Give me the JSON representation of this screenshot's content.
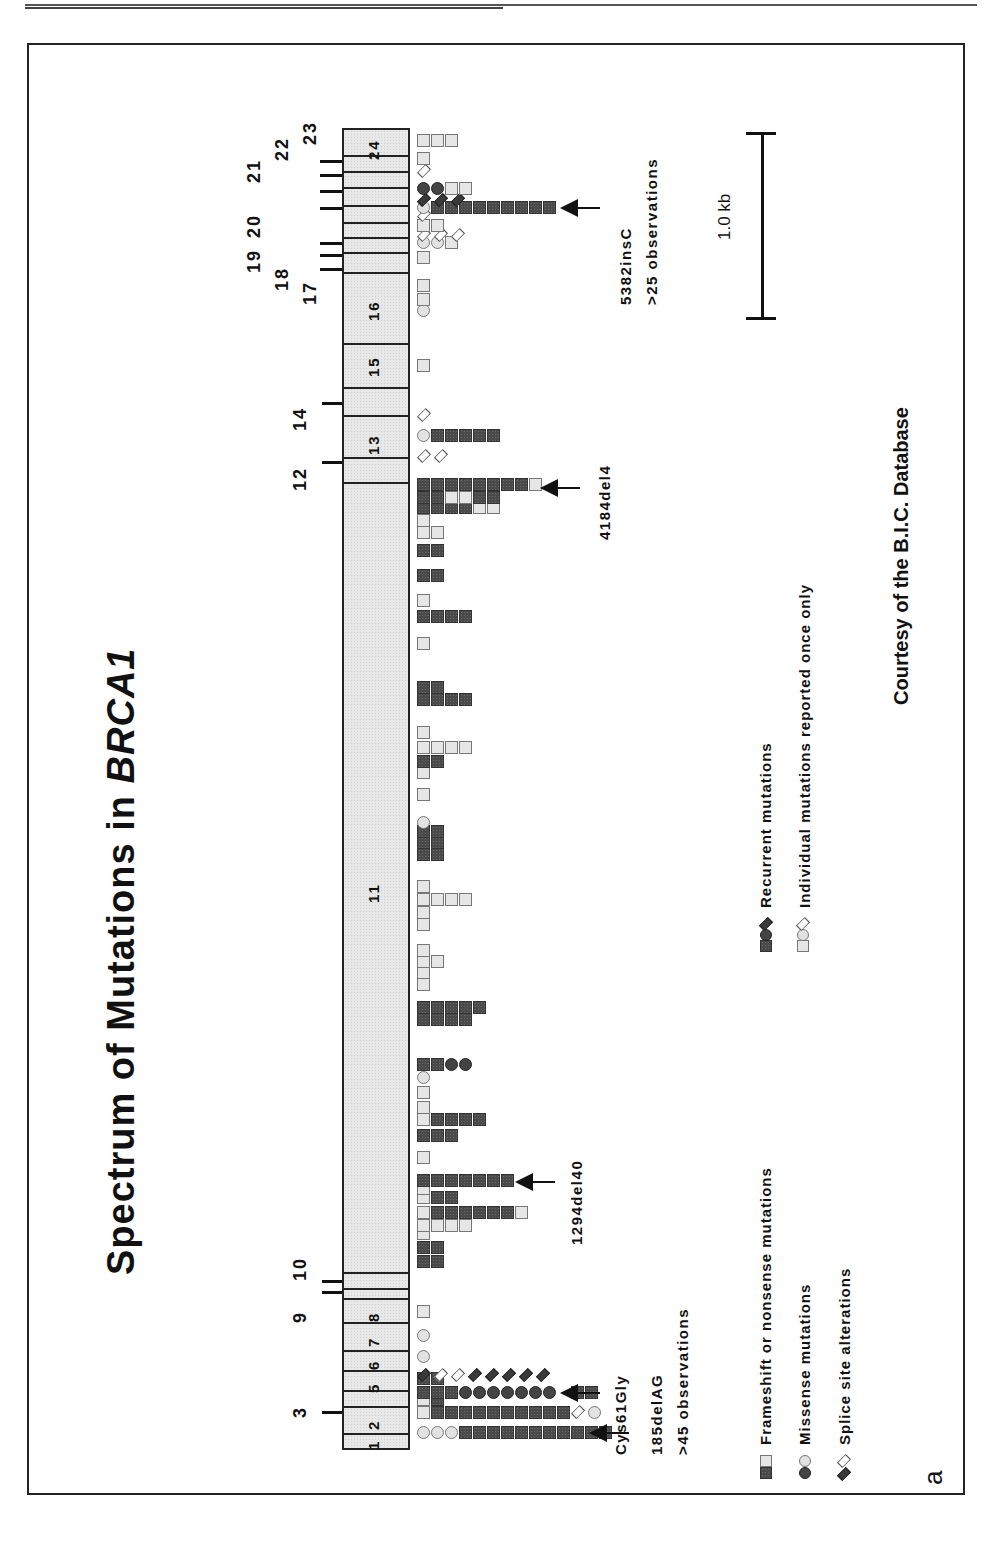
{
  "figure": {
    "title_prefix": "Spectrum of Mutations in ",
    "title_gene": "BRCA1",
    "panel_letter": "a",
    "credit": "Courtesy of the B.I.C. Database",
    "scale_bar_label": "1.0 kb"
  },
  "colors": {
    "recurrent_fill": "#4a4a4a",
    "individual_fill": "#e6e6e6",
    "gene_fill": "#e8e8e8",
    "outline": "#222222"
  },
  "gene": {
    "name": "BRCA1",
    "exons_inside": [
      {
        "label": "1",
        "y0": 1433,
        "y1": 1450
      },
      {
        "label": "2",
        "y0": 1406,
        "y1": 1433
      },
      {
        "label": "3",
        "y0": 1390,
        "y1": 1406
      },
      {
        "label": "5",
        "y0": 1370,
        "y1": 1390
      },
      {
        "label": "6",
        "y0": 1350,
        "y1": 1370
      },
      {
        "label": "7",
        "y0": 1322,
        "y1": 1350
      },
      {
        "label": "8",
        "y0": 1298,
        "y1": 1322
      },
      {
        "label": "9",
        "y0": 1288,
        "y1": 1298
      },
      {
        "label": "10",
        "y0": 1272,
        "y1": 1288
      },
      {
        "label": "11",
        "y0": 482,
        "y1": 1272
      },
      {
        "label": "12",
        "y0": 457,
        "y1": 482
      },
      {
        "label": "13",
        "y0": 415,
        "y1": 457
      },
      {
        "label": "14",
        "y0": 387,
        "y1": 415
      },
      {
        "label": "15",
        "y0": 343,
        "y1": 387
      },
      {
        "label": "16",
        "y0": 272,
        "y1": 343
      },
      {
        "label": "17",
        "y0": 252,
        "y1": 272
      },
      {
        "label": "18",
        "y0": 237,
        "y1": 252
      },
      {
        "label": "19",
        "y0": 222,
        "y1": 237
      },
      {
        "label": "20",
        "y0": 205,
        "y1": 222
      },
      {
        "label": "21",
        "y0": 187,
        "y1": 205
      },
      {
        "label": "22",
        "y0": 171,
        "y1": 187
      },
      {
        "label": "23",
        "y0": 155,
        "y1": 171
      },
      {
        "label": "24",
        "y0": 128,
        "y1": 155
      }
    ],
    "visible_inner_labels": [
      {
        "text": "1",
        "y": 1445
      },
      {
        "text": "2",
        "y": 1425
      },
      {
        "text": "5",
        "y": 1388
      },
      {
        "text": "6",
        "y": 1365
      },
      {
        "text": "7",
        "y": 1342
      },
      {
        "text": "8",
        "y": 1317
      },
      {
        "text": "11",
        "y": 893
      },
      {
        "text": "13",
        "y": 445
      },
      {
        "text": "15",
        "y": 367
      },
      {
        "text": "16",
        "y": 311
      },
      {
        "text": "24",
        "y": 150
      }
    ],
    "outer_labels": [
      {
        "text": "3",
        "x": 300,
        "y": 1412
      },
      {
        "text": "9",
        "x": 300,
        "y": 1317
      },
      {
        "text": "10",
        "x": 300,
        "y": 1268
      },
      {
        "text": "12",
        "x": 300,
        "y": 478
      },
      {
        "text": "14",
        "x": 300,
        "y": 418
      },
      {
        "text": "17",
        "x": 310,
        "y": 292
      },
      {
        "text": "18",
        "x": 282,
        "y": 278
      },
      {
        "text": "19",
        "x": 254,
        "y": 260
      },
      {
        "text": "20",
        "x": 254,
        "y": 225
      },
      {
        "text": "21",
        "x": 254,
        "y": 170
      },
      {
        "text": "22",
        "x": 282,
        "y": 148
      },
      {
        "text": "23",
        "x": 310,
        "y": 132
      }
    ]
  },
  "annotations": [
    {
      "label": "185delAG",
      "sublabel": ">45 observations",
      "arrow_y": 1433
    },
    {
      "label": "Cys61Gly",
      "sublabel": "",
      "arrow_y": 1393
    },
    {
      "label": "1294del40",
      "sublabel": "",
      "arrow_y": 1183
    },
    {
      "label": "4184del4",
      "sublabel": "",
      "arrow_y": 488
    },
    {
      "label": "5382insC",
      "sublabel": ">25 observations",
      "arrow_y": 208
    }
  ],
  "legend": {
    "left": [
      {
        "icon": "square",
        "label": "Frameshift or nonsense mutations"
      },
      {
        "icon": "circle",
        "label": "Missense mutations"
      },
      {
        "icon": "diamond",
        "label": "Splice site alterations"
      }
    ],
    "right": [
      {
        "style": "filled",
        "label": "Recurrent mutations"
      },
      {
        "style": "open",
        "label": "Individual mutations reported once only"
      }
    ]
  },
  "chart_data": {
    "type": "table",
    "title": "Spectrum of Mutations in BRCA1",
    "x_axis": "position along BRCA1 coding sequence (exons 1-24)",
    "scale_bar": "1.0 kb",
    "named_hotspots": [
      {
        "mutation": "185delAG",
        "exon": "2",
        "type": "frameshift",
        "observations": ">45"
      },
      {
        "mutation": "Cys61Gly",
        "exon": "5",
        "type": "missense",
        "observations": "recurrent"
      },
      {
        "mutation": "1294del40",
        "exon": "11",
        "type": "frameshift",
        "observations": "recurrent"
      },
      {
        "mutation": "4184del4",
        "exon": "11",
        "type": "frameshift",
        "observations": "recurrent"
      },
      {
        "mutation": "5382insC",
        "exon": "20",
        "type": "frameshift",
        "observations": ">25"
      }
    ],
    "legend": [
      "Frameshift or nonsense mutations",
      "Missense mutations",
      "Splice site alterations",
      "Recurrent mutations (filled)",
      "Individual mutations reported once only (open)"
    ]
  },
  "rows": [
    {
      "y": 1433,
      "items": [
        [
          "c",
          "e",
          1
        ],
        [
          "c",
          "e",
          1
        ],
        [
          "c",
          "e",
          1
        ],
        [
          "s",
          "f",
          11
        ]
      ],
      "offset": [
        0,
        15,
        36
      ]
    },
    {
      "y": 1413,
      "items": [
        [
          "s",
          "e",
          1
        ],
        [
          "s",
          "f",
          10
        ],
        [
          "d",
          "e",
          1
        ],
        [
          "c",
          "e",
          1
        ]
      ]
    },
    {
      "y": 1400,
      "items": [
        [
          "s",
          "e",
          1
        ],
        [
          "s",
          "f",
          1
        ]
      ]
    },
    {
      "y": 1393,
      "items": [
        [
          "s",
          "f",
          3
        ],
        [
          "c",
          "f",
          7
        ],
        [
          "gap",
          0,
          1
        ],
        [
          "s",
          "f",
          2
        ]
      ]
    },
    {
      "y": 1379,
      "items": [
        [
          "s",
          "f",
          2
        ]
      ]
    },
    {
      "y": 1376,
      "items": [
        [
          "d",
          "m",
          8
        ]
      ]
    },
    {
      "y": 1357,
      "items": [
        [
          "c",
          "e",
          1
        ]
      ]
    },
    {
      "y": 1336,
      "items": [
        [
          "c",
          "e",
          1
        ]
      ]
    },
    {
      "y": 1312,
      "items": [
        [
          "s",
          "e",
          1
        ]
      ]
    },
    {
      "y": 1262,
      "items": [
        [
          "s",
          "f",
          2
        ]
      ]
    },
    {
      "y": 1248,
      "items": [
        [
          "s",
          "f",
          2
        ]
      ]
    },
    {
      "y": 1234,
      "items": [
        [
          "s",
          "e",
          1
        ]
      ]
    },
    {
      "y": 1226,
      "items": [
        [
          "s",
          "e",
          4
        ]
      ]
    },
    {
      "y": 1213,
      "items": [
        [
          "s",
          "e",
          1
        ],
        [
          "s",
          "f",
          6
        ],
        [
          "s",
          "e",
          1
        ]
      ]
    },
    {
      "y": 1198,
      "items": [
        [
          "s",
          "e",
          1
        ],
        [
          "s",
          "f",
          2
        ]
      ]
    },
    {
      "y": 1189,
      "items": [
        [
          "s",
          "e",
          1
        ]
      ]
    },
    {
      "y": 1181,
      "items": [
        [
          "s",
          "f",
          7
        ]
      ]
    },
    {
      "y": 1158,
      "items": [
        [
          "s",
          "e",
          1
        ]
      ]
    },
    {
      "y": 1136,
      "items": [
        [
          "s",
          "f",
          3
        ]
      ]
    },
    {
      "y": 1120,
      "items": [
        [
          "s",
          "e",
          1
        ],
        [
          "s",
          "f",
          4
        ]
      ]
    },
    {
      "y": 1108,
      "items": [
        [
          "s",
          "e",
          1
        ]
      ]
    },
    {
      "y": 1093,
      "items": [
        [
          "s",
          "e",
          1
        ]
      ]
    },
    {
      "y": 1078,
      "items": [
        [
          "c",
          "e",
          1
        ]
      ]
    },
    {
      "y": 1065,
      "items": [
        [
          "s",
          "f",
          2
        ],
        [
          "c",
          "f",
          2
        ]
      ]
    },
    {
      "y": 1020,
      "items": [
        [
          "s",
          "f",
          4
        ]
      ]
    },
    {
      "y": 1008,
      "items": [
        [
          "s",
          "f",
          5
        ]
      ]
    },
    {
      "y": 985,
      "items": [
        [
          "s",
          "e",
          1
        ]
      ]
    },
    {
      "y": 973,
      "items": [
        [
          "s",
          "e",
          1
        ]
      ]
    },
    {
      "y": 962,
      "items": [
        [
          "s",
          "e",
          2
        ]
      ]
    },
    {
      "y": 951,
      "items": [
        [
          "s",
          "e",
          1
        ]
      ]
    },
    {
      "y": 925,
      "items": [
        [
          "s",
          "e",
          1
        ]
      ]
    },
    {
      "y": 913,
      "items": [
        [
          "s",
          "e",
          1
        ]
      ]
    },
    {
      "y": 900,
      "items": [
        [
          "s",
          "e",
          4
        ]
      ]
    },
    {
      "y": 887,
      "items": [
        [
          "s",
          "e",
          1
        ]
      ]
    },
    {
      "y": 855,
      "items": [
        [
          "s",
          "f",
          2
        ]
      ]
    },
    {
      "y": 843,
      "items": [
        [
          "s",
          "f",
          2
        ]
      ]
    },
    {
      "y": 832,
      "items": [
        [
          "s",
          "f",
          2
        ]
      ]
    },
    {
      "y": 823,
      "items": [
        [
          "c",
          "e",
          1
        ]
      ]
    },
    {
      "y": 795,
      "items": [
        [
          "s",
          "e",
          1
        ]
      ]
    },
    {
      "y": 773,
      "items": [
        [
          "s",
          "e",
          1
        ]
      ]
    },
    {
      "y": 762,
      "items": [
        [
          "s",
          "f",
          2
        ]
      ]
    },
    {
      "y": 748,
      "items": [
        [
          "s",
          "e",
          4
        ]
      ]
    },
    {
      "y": 733,
      "items": [
        [
          "s",
          "e",
          1
        ]
      ]
    },
    {
      "y": 700,
      "items": [
        [
          "s",
          "f",
          4
        ]
      ]
    },
    {
      "y": 688,
      "items": [
        [
          "s",
          "f",
          2
        ]
      ]
    },
    {
      "y": 644,
      "items": [
        [
          "s",
          "e",
          1
        ]
      ]
    },
    {
      "y": 617,
      "items": [
        [
          "s",
          "f",
          4
        ]
      ]
    },
    {
      "y": 601,
      "items": [
        [
          "s",
          "e",
          1
        ]
      ]
    },
    {
      "y": 576,
      "items": [
        [
          "s",
          "f",
          2
        ]
      ]
    },
    {
      "y": 551,
      "items": [
        [
          "s",
          "f",
          2
        ]
      ]
    },
    {
      "y": 533,
      "items": [
        [
          "s",
          "e",
          2
        ]
      ]
    },
    {
      "y": 521,
      "items": [
        [
          "s",
          "e",
          1
        ]
      ]
    },
    {
      "y": 508,
      "items": [
        [
          "s",
          "f",
          4
        ],
        [
          "s",
          "e",
          2
        ]
      ]
    },
    {
      "y": 498,
      "items": [
        [
          "s",
          "f",
          2
        ],
        [
          "s",
          "e",
          2
        ],
        [
          "s",
          "f",
          2
        ]
      ]
    },
    {
      "y": 485,
      "items": [
        [
          "s",
          "f",
          8
        ],
        [
          "s",
          "e",
          1
        ]
      ]
    },
    {
      "y": 457,
      "items": [
        [
          "d",
          "e",
          2
        ]
      ]
    },
    {
      "y": 436,
      "items": [
        [
          "c",
          "e",
          1
        ],
        [
          "s",
          "f",
          5
        ]
      ]
    },
    {
      "y": 416,
      "items": [
        [
          "d",
          "e",
          1
        ]
      ]
    },
    {
      "y": 366,
      "items": [
        [
          "s",
          "e",
          1
        ]
      ]
    },
    {
      "y": 311,
      "items": [
        [
          "c",
          "e",
          1
        ]
      ]
    },
    {
      "y": 300,
      "items": [
        [
          "s",
          "e",
          1
        ]
      ]
    },
    {
      "y": 286,
      "items": [
        [
          "s",
          "e",
          1
        ]
      ]
    },
    {
      "y": 258,
      "items": [
        [
          "s",
          "e",
          1
        ]
      ]
    },
    {
      "y": 243,
      "items": [
        [
          "c",
          "e",
          2
        ],
        [
          "s",
          "e",
          1
        ]
      ]
    },
    {
      "y": 236,
      "items": [
        [
          "d",
          "e",
          3
        ]
      ]
    },
    {
      "y": 226,
      "items": [
        [
          "s",
          "e",
          2
        ]
      ]
    },
    {
      "y": 216,
      "items": [
        [
          "d",
          "e",
          1
        ]
      ]
    },
    {
      "y": 208,
      "items": [
        [
          "c",
          "e",
          1
        ],
        [
          "s",
          "f",
          9
        ]
      ]
    },
    {
      "y": 201,
      "items": [
        [
          "d",
          "f",
          3
        ]
      ]
    },
    {
      "y": 189,
      "items": [
        [
          "c",
          "f",
          2
        ],
        [
          "s",
          "e",
          2
        ]
      ]
    },
    {
      "y": 172,
      "items": [
        [
          "d",
          "e",
          1
        ]
      ]
    },
    {
      "y": 159,
      "items": [
        [
          "s",
          "e",
          1
        ]
      ]
    },
    {
      "y": 141,
      "items": [
        [
          "s",
          "e",
          3
        ]
      ]
    }
  ]
}
